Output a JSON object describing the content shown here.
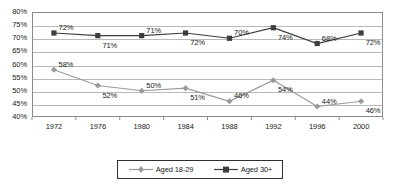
{
  "chart_data": {
    "type": "line",
    "title": "",
    "subtitle": "",
    "xlabel": "",
    "ylabel": "",
    "categories": [
      "1972",
      "1976",
      "1980",
      "1984",
      "1988",
      "1992",
      "1996",
      "2000"
    ],
    "ylim": [
      40,
      80
    ],
    "ytick_step": 5,
    "yticks": [
      "40%",
      "45%",
      "50%",
      "55%",
      "60%",
      "65%",
      "70%",
      "75%",
      "80%"
    ],
    "ytick_values": [
      40,
      45,
      50,
      55,
      60,
      65,
      70,
      75,
      80
    ],
    "grid": true,
    "legend_position": "bottom",
    "series": [
      {
        "name": "Aged 18-29",
        "marker": "diamond",
        "color": "#9a9a9a",
        "values": [
          58,
          52,
          50,
          51,
          46,
          54,
          44,
          46
        ],
        "labels": [
          "58%",
          "52%",
          "50%",
          "51%",
          "46%",
          "54%",
          "44%",
          "46%"
        ],
        "label_positions": [
          "above",
          "below",
          "above",
          "below",
          "above",
          "below",
          "above",
          "below"
        ]
      },
      {
        "name": "Aged 30+",
        "marker": "square",
        "color": "#3d3d3d",
        "values": [
          72,
          71,
          71,
          72,
          70,
          74,
          68,
          72
        ],
        "labels": [
          "72%",
          "71%",
          "71%",
          "72%",
          "70%",
          "74%",
          "68%",
          "72%"
        ],
        "label_positions": [
          "above",
          "below",
          "above",
          "below",
          "above",
          "below",
          "above",
          "below"
        ]
      }
    ]
  },
  "legend": {
    "items": [
      {
        "label": "Aged 18-29"
      },
      {
        "label": "Aged 30+"
      }
    ]
  }
}
